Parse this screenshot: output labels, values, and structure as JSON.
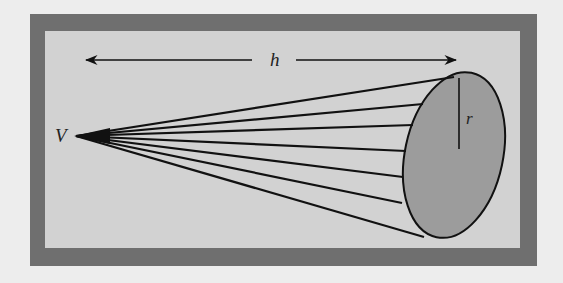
{
  "diagram": {
    "colors": {
      "page_background": "#ededed",
      "frame": "#6f6f6f",
      "panel": "#d2d2d2",
      "base_fill": "#9c9c9c",
      "stroke": "#111111"
    },
    "labels": {
      "vertex": "V",
      "height": "h",
      "radius": "r"
    },
    "elements": [
      "outer-frame",
      "height-arrow",
      "cone-surface-lines",
      "cone-base-ellipse",
      "radius-line"
    ]
  }
}
